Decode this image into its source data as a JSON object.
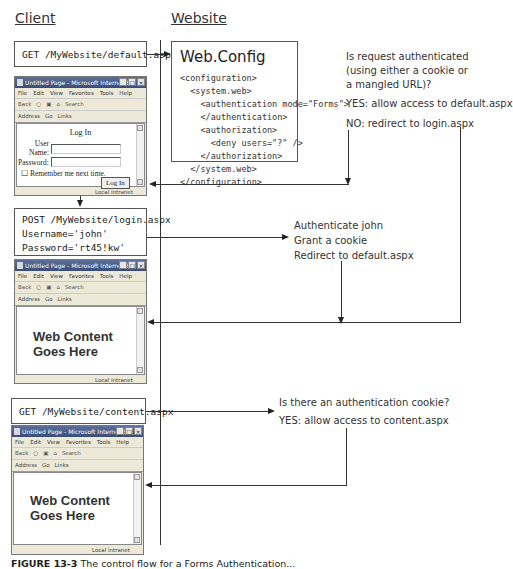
{
  "headings": {
    "client": "Client",
    "website": "Website"
  },
  "requests": {
    "get_default": "GET /MyWebsite/default.aspx",
    "post_login": "POST /MyWebsite/login.aspx\nUsername='john'\nPassword='rt45!kw'",
    "get_content": "GET /MyWebsite/content.aspx"
  },
  "webconfig": {
    "title": "Web.Config",
    "code": "<configuration>\n  <system.web>\n    <authentication mode=\"Forms\">\n    </authentication>\n    <authorization>\n      <deny users=\"?\" />\n    </authorization>\n  </system.web>\n</configuration>"
  },
  "notes": {
    "auth_check": [
      "Is request authenticated",
      "(using either a cookie or",
      "a mangled URL)?"
    ],
    "auth_yes": "YES: allow access to default.aspx",
    "auth_no": "NO: redirect to login.aspx",
    "login_steps": [
      "Authenticate john",
      "Grant a cookie",
      "Redirect to default.aspx"
    ],
    "cookie_check": "Is there an authentication cookie?",
    "cookie_yes": "YES: allow access to content.aspx"
  },
  "browser": {
    "title": "Untitled Page - Microsoft Internet E...",
    "menu": [
      "File",
      "Edit",
      "View",
      "Favorites",
      "Tools",
      "Help"
    ],
    "toolbar": [
      "Back",
      "▾",
      "○",
      "▾",
      "▣",
      "⌂",
      "Search"
    ],
    "address_label": "Address",
    "go_label": "Go",
    "links_label": "Links",
    "status_zone": "Local intranet",
    "window_buttons": [
      "_",
      "□",
      "×"
    ]
  },
  "login_form": {
    "title": "Log In",
    "username_label": "User\nName:",
    "password_label": "Password:",
    "remember_label": "Remember me next time.",
    "button_label": "Log In"
  },
  "web_content": "Web Content\nGoes Here",
  "caption": {
    "label": "FIGURE 13-3",
    "text": "The control flow for a Forms Authentication..."
  }
}
